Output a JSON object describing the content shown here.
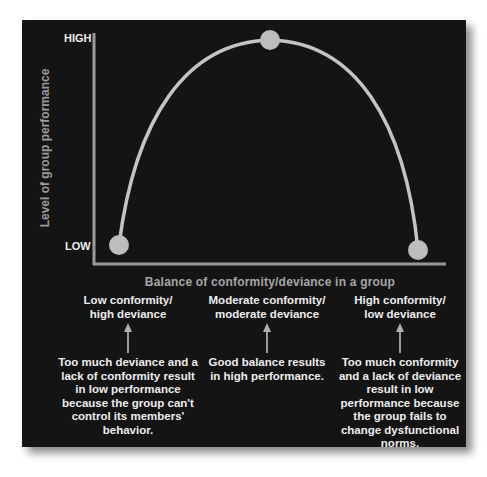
{
  "diagram": {
    "y_axis": {
      "label": "Level of group performance",
      "high_label": "HIGH",
      "low_label": "LOW"
    },
    "x_axis": {
      "label": "Balance of conformity/deviance in a group"
    },
    "curve": {
      "shape": "inverted-u",
      "points": [
        {
          "name": "low-conformity-point",
          "level": "LOW"
        },
        {
          "name": "moderate-conformity-point",
          "level": "HIGH"
        },
        {
          "name": "high-conformity-point",
          "level": "LOW"
        }
      ],
      "colors": {
        "curve": "#c4c4c4",
        "points": "#bdbdbd",
        "axes": "#9a9a9a",
        "background": "#141414"
      }
    },
    "columns": [
      {
        "heading_line1": "Low conformity/",
        "heading_line2": "high deviance",
        "body": "Too much deviance and a lack of conformity result in low performance because the group can't control its members' behavior."
      },
      {
        "heading_line1": "Moderate conformity/",
        "heading_line2": "moderate deviance",
        "body": "Good balance results in high performance."
      },
      {
        "heading_line1": "High conformity/",
        "heading_line2": "low deviance",
        "body": "Too much conformity and a lack of deviance result in low performance because the group fails to change dysfunctional norms."
      }
    ]
  }
}
